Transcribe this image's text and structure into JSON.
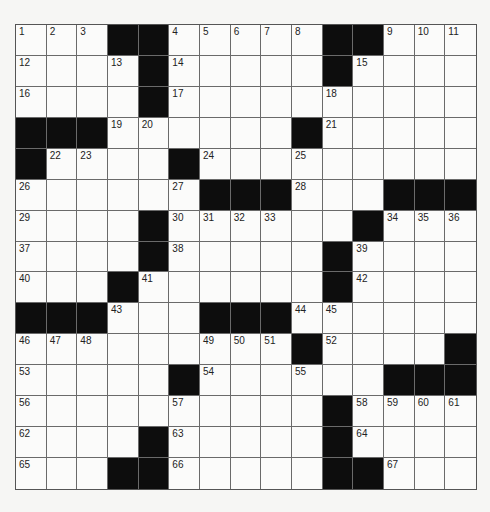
{
  "puzzle": {
    "rows": 15,
    "cols": 15,
    "colors": {
      "background": "#f6f6f4",
      "cell": "#fbfbfa",
      "block": "#0d0d0d",
      "gridline": "#6a6a6a"
    },
    "grid": [
      [
        1,
        2,
        3,
        "#",
        "#",
        4,
        5,
        6,
        7,
        8,
        "#",
        "#",
        9,
        10,
        11
      ],
      [
        12,
        0,
        0,
        13,
        "#",
        14,
        0,
        0,
        0,
        0,
        "#",
        15,
        0,
        0,
        0
      ],
      [
        16,
        0,
        0,
        0,
        "#",
        17,
        0,
        0,
        0,
        0,
        18,
        0,
        0,
        0,
        0
      ],
      [
        "#",
        "#",
        "#",
        19,
        20,
        0,
        0,
        0,
        0,
        "#",
        21,
        0,
        0,
        0,
        0
      ],
      [
        "#",
        22,
        23,
        0,
        0,
        "#",
        24,
        0,
        0,
        25,
        0,
        0,
        0,
        0,
        0
      ],
      [
        26,
        0,
        0,
        0,
        0,
        27,
        "#",
        "#",
        "#",
        28,
        0,
        0,
        "#",
        "#",
        "#"
      ],
      [
        29,
        0,
        0,
        0,
        "#",
        30,
        31,
        32,
        33,
        0,
        0,
        "#",
        34,
        35,
        36
      ],
      [
        37,
        0,
        0,
        0,
        "#",
        38,
        0,
        0,
        0,
        0,
        "#",
        39,
        0,
        0,
        0
      ],
      [
        40,
        0,
        0,
        "#",
        41,
        0,
        0,
        0,
        0,
        0,
        "#",
        42,
        0,
        0,
        0
      ],
      [
        "#",
        "#",
        "#",
        43,
        0,
        0,
        "#",
        "#",
        "#",
        44,
        45,
        0,
        0,
        0,
        0
      ],
      [
        46,
        47,
        48,
        0,
        0,
        0,
        49,
        50,
        51,
        "#",
        52,
        0,
        0,
        0,
        "#"
      ],
      [
        53,
        0,
        0,
        0,
        0,
        "#",
        54,
        0,
        0,
        55,
        0,
        0,
        "#",
        "#",
        "#"
      ],
      [
        56,
        0,
        0,
        0,
        0,
        57,
        0,
        0,
        0,
        0,
        "#",
        58,
        59,
        60,
        61
      ],
      [
        62,
        0,
        0,
        0,
        "#",
        63,
        0,
        0,
        0,
        0,
        "#",
        64,
        0,
        0,
        0
      ],
      [
        65,
        0,
        0,
        "#",
        "#",
        66,
        0,
        0,
        0,
        0,
        "#",
        "#",
        67,
        0,
        0
      ]
    ],
    "entries": {}
  }
}
